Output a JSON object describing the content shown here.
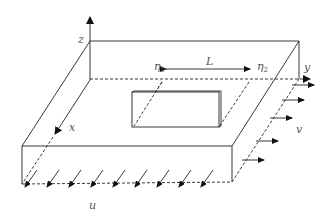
{
  "diagram": {
    "labels": {
      "z_axis": "z",
      "x_axis": "x",
      "y_axis": "y",
      "eta1": "η",
      "eta1_sub": "1",
      "eta2": "η",
      "eta2_sub": "2",
      "length": "L",
      "u": "u",
      "v": "v"
    },
    "colors": {
      "line": "#222222",
      "label": "#555555"
    },
    "u_arrow_count": 8,
    "v_arrow_count": 5
  }
}
